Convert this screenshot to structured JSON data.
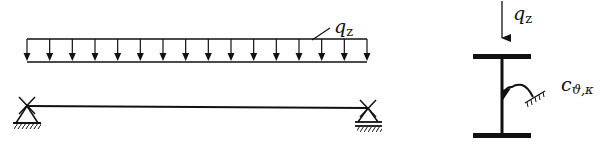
{
  "beam_diagram": {
    "load_label": "q",
    "load_subscript": "z",
    "arrow_count": 16,
    "supports": [
      "left-pinned-support",
      "right-roller-support"
    ]
  },
  "section_diagram": {
    "load_label": "q",
    "load_subscript": "z",
    "spring_label": "c",
    "spring_subscript": "ϑ,κ"
  },
  "colors": {
    "stroke": "#111111",
    "background": "#ffffff"
  }
}
